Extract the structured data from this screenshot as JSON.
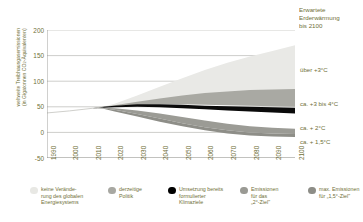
{
  "corner_title": {
    "line1": "Erwartete",
    "line2": "Erderwärmung",
    "line3": "bis 2100"
  },
  "axis": {
    "y_caption_line1": "weltweite Treibhausgasemissionen",
    "y_caption_line2_pre": "(in Gigatonnen CO",
    "y_caption_sub": "2",
    "y_caption_line2_post": "-Äquivalenten)",
    "y_ticks": [
      "200",
      "150",
      "100",
      "50",
      "0",
      "-50"
    ],
    "x_ticks": [
      "1990",
      "2000",
      "2010",
      "2020",
      "2030",
      "2040",
      "2050",
      "2060",
      "2070",
      "2080",
      "2090",
      "2100"
    ]
  },
  "band_labels": [
    {
      "text": "über +3°C"
    },
    {
      "text": "ca. +3 bis 4°C"
    },
    {
      "text": "ca. + 2°C"
    },
    {
      "text": "ca. + 1,5°C"
    }
  ],
  "legend": [
    {
      "label": "keine Verände-\nrung des globalen\nEnergiesystems",
      "color": "#e8e8e4"
    },
    {
      "label": "derzeitige\nPolitik",
      "color": "#a8a8a2"
    },
    {
      "label": "Umsetzung bereits\nformulierter\nKlimaziele",
      "color": "#000000"
    },
    {
      "label": "Emissionen\nfür das\n„2°-Ziel\"",
      "color": "#9a9a94"
    },
    {
      "label": "max. Emissionen\nfür „1,5°-Ziel\"",
      "color": "#8d8d87"
    }
  ],
  "colors": {
    "text": "#6f6f37",
    "grid": "#b9b9b5",
    "axis": "#8a8a86",
    "band_nochange": "#e9e9e6",
    "band_current": "#a9a9a3",
    "band_pledges": "#0a0a0a",
    "band_2deg": "#9b9b95",
    "band_15deg": "#8e8e88"
  },
  "chart_data": {
    "type": "area",
    "title": "Erwartete Erderwärmung bis 2100",
    "xlabel": "",
    "ylabel": "weltweite Treibhausgasemissionen (in Gigatonnen CO2-Äquivalenten)",
    "xlim": [
      1990,
      2100
    ],
    "ylim": [
      -50,
      200
    ],
    "grid": true,
    "legend_position": "bottom",
    "x": [
      1990,
      2000,
      2010,
      2015,
      2020,
      2030,
      2040,
      2050,
      2060,
      2070,
      2080,
      2090,
      2100
    ],
    "series": [
      {
        "name": "keine Veränderung des globalen Energiesystems",
        "label": "über +3°C",
        "color": "#e9e9e6",
        "upper": [
          38,
          42,
          47,
          50,
          56,
          72,
          89,
          106,
          122,
          136,
          148,
          159,
          170
        ],
        "lower": [
          38,
          42,
          47,
          49,
          52,
          58,
          62,
          65,
          68,
          70,
          72,
          74,
          76
        ]
      },
      {
        "name": "derzeitige Politik",
        "label": "ca. +3 bis 4°C",
        "color": "#a9a9a3",
        "upper": [
          38,
          42,
          47,
          50,
          53,
          60,
          66,
          72,
          77,
          80,
          83,
          84,
          85
        ],
        "lower": [
          38,
          42,
          47,
          49,
          51,
          54,
          55,
          55,
          54,
          53,
          52,
          51,
          50
        ]
      },
      {
        "name": "Umsetzung bereits formulierter Klimaziele",
        "label": "ca. + 2°C",
        "color": "#0a0a0a",
        "upper": [
          38,
          42,
          47,
          50,
          52,
          55,
          55,
          54,
          52,
          51,
          50,
          49,
          48
        ],
        "lower": [
          38,
          42,
          47,
          48,
          49,
          50,
          49,
          47,
          45,
          43,
          41,
          39,
          37
        ]
      },
      {
        "name": "Emissionen für das „2°-Ziel\"",
        "label": "ca. + 2°C",
        "color": "#9b9b95",
        "upper": [
          38,
          42,
          47,
          48,
          47,
          43,
          37,
          30,
          23,
          17,
          12,
          9,
          7
        ],
        "lower": [
          38,
          42,
          47,
          47,
          44,
          36,
          27,
          18,
          10,
          4,
          0,
          -2,
          -3
        ]
      },
      {
        "name": "max. Emissionen für „1,5°-Ziel\"",
        "label": "ca. + 1,5°C",
        "color": "#8e8e88",
        "upper": [
          38,
          42,
          47,
          47,
          44,
          36,
          27,
          18,
          10,
          4,
          0,
          -2,
          -3
        ],
        "lower": [
          38,
          42,
          47,
          46,
          41,
          31,
          21,
          12,
          4,
          -2,
          -6,
          -8,
          -9
        ]
      }
    ]
  }
}
